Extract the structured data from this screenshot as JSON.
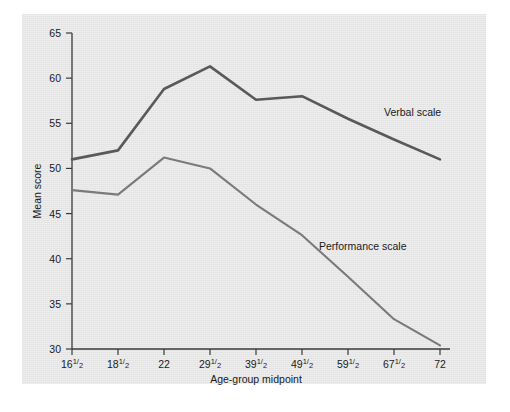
{
  "chart_data": {
    "type": "line",
    "title": "",
    "xlabel": "Age-group midpoint",
    "ylabel": "Mean score",
    "categories": [
      "16½",
      "18½",
      "22",
      "29½",
      "39½",
      "49½",
      "59½",
      "67½",
      "72"
    ],
    "x_tick_labels": [
      {
        "whole": "16",
        "num": "1",
        "den": "2"
      },
      {
        "whole": "18",
        "num": "1",
        "den": "2"
      },
      {
        "whole": "22",
        "num": "",
        "den": ""
      },
      {
        "whole": "29",
        "num": "1",
        "den": "2"
      },
      {
        "whole": "39",
        "num": "1",
        "den": "2"
      },
      {
        "whole": "49",
        "num": "1",
        "den": "2"
      },
      {
        "whole": "59",
        "num": "1",
        "den": "2"
      },
      {
        "whole": "67",
        "num": "1",
        "den": "2"
      },
      {
        "whole": "72",
        "num": "",
        "den": ""
      }
    ],
    "y_tick_labels": [
      "30",
      "35",
      "40",
      "45",
      "50",
      "55",
      "60",
      "65"
    ],
    "ylim": [
      30,
      65
    ],
    "y_step": 5,
    "grid": false,
    "legend_position": "inline-annotations",
    "series": [
      {
        "name": "Verbal scale",
        "color": "#595959",
        "stroke_width": 2.6,
        "values": [
          51.0,
          52.0,
          58.8,
          61.3,
          57.6,
          58.0,
          55.5,
          53.2,
          51.0
        ]
      },
      {
        "name": "Performance scale",
        "color": "#7a7a7a",
        "stroke_width": 2.1,
        "values": [
          47.6,
          47.1,
          51.2,
          50.0,
          46.0,
          42.6,
          38.0,
          33.3,
          30.4
        ]
      }
    ],
    "annotations": [
      {
        "text": "Verbal scale",
        "x_px": 384,
        "y_px": 116
      },
      {
        "text": "Performance scale",
        "x_px": 319,
        "y_px": 250
      }
    ],
    "colors": {
      "panel_background": "#e8e8e8",
      "page_background": "#ffffff",
      "axis": "#3a3a3a",
      "text": "#1a1a1a",
      "verbal": "#595959",
      "performance": "#7a7a7a"
    },
    "geometry": {
      "plot_left": 72,
      "plot_right": 440,
      "plot_top": 33,
      "plot_bottom": 349
    }
  }
}
